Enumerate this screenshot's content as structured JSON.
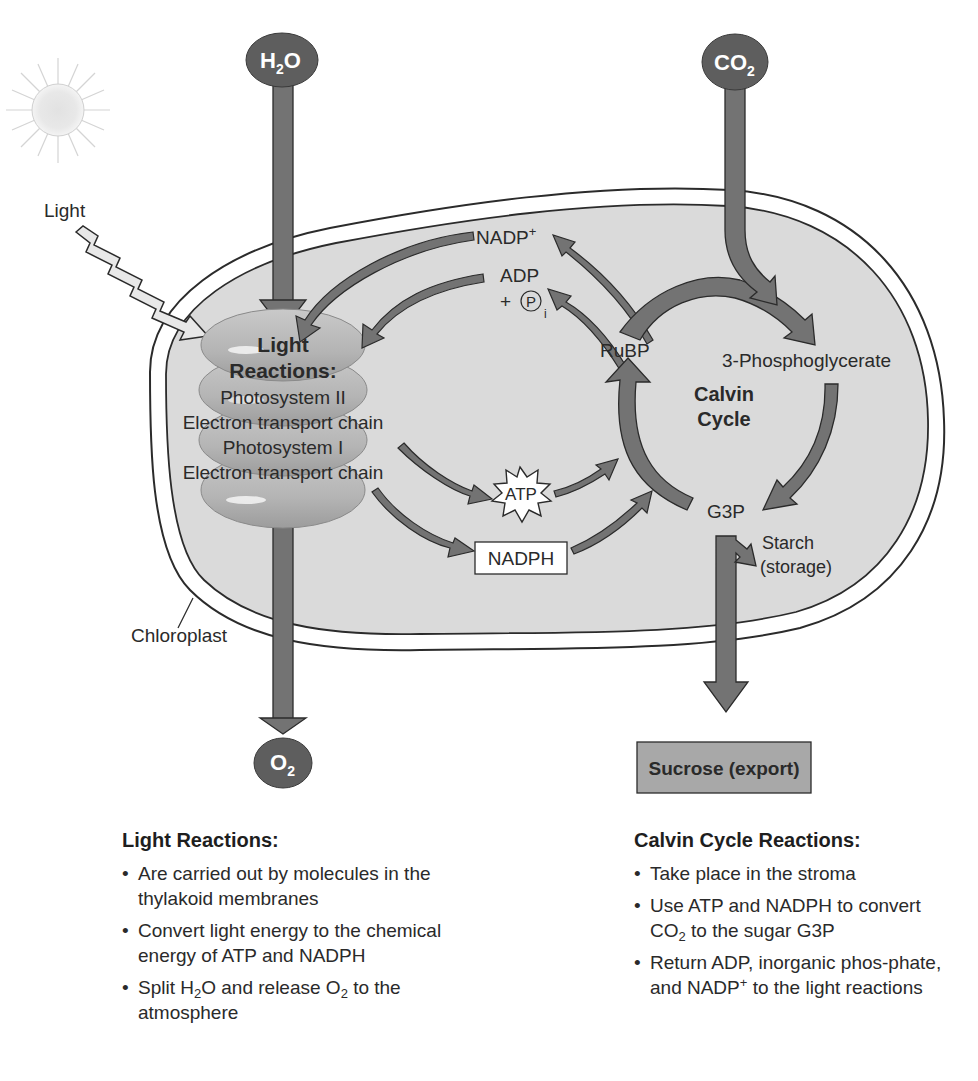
{
  "inputs": {
    "water": {
      "label": "H",
      "sub": "2",
      "suffix": "O"
    },
    "carbon_dioxide": {
      "label": "CO",
      "sub": "2"
    }
  },
  "outputs": {
    "oxygen": {
      "label": "O",
      "sub": "2"
    },
    "sucrose": "Sucrose (export)",
    "starch_line1": "Starch",
    "starch_line2": "(storage)"
  },
  "light_label": "Light",
  "chloroplast_label": "Chloroplast",
  "thylakoid": {
    "title_line1": "Light",
    "title_line2": "Reactions:",
    "items": [
      "Photosystem II",
      "Electron transport chain",
      "Photosystem I",
      "Electron transport chain"
    ]
  },
  "carriers": {
    "nadp_plus": "NADP",
    "nadp_plus_sup": "+",
    "adp": "ADP",
    "plus": "+",
    "pi_symbol": "P",
    "pi_sub": "i",
    "atp": "ATP",
    "nadph": "NADPH"
  },
  "calvin": {
    "title_line1": "Calvin",
    "title_line2": "Cycle",
    "rubp": "RuBP",
    "pga": "3-Phosphoglycerate",
    "g3p": "G3P"
  },
  "notes_light": {
    "title": "Light Reactions:",
    "bullets": [
      "Are carried out by molecules in the thylakoid membranes",
      "Convert light energy to the chemical energy of ATP and NADPH",
      {
        "pre": "Split H",
        "sub1": "2",
        "mid": "O and release O",
        "sub2": "2",
        "post": " to the atmosphere"
      }
    ]
  },
  "notes_calvin": {
    "title": "Calvin Cycle Reactions:",
    "bullets": [
      "Take place in the stroma",
      {
        "pre": "Use ATP and NADPH to convert CO",
        "sub": "2",
        "post": " to the sugar G3P"
      },
      {
        "pre": "Return ADP, inorganic phos-phate, and NADP",
        "sup": "+",
        "post": " to the light reactions"
      }
    ]
  },
  "colors": {
    "arrow_fill": "#737373",
    "arrow_stroke": "#2b2b2b",
    "molecule_fill": "#5e5e5e",
    "stroma_fill": "#dadada",
    "thylakoid_fill": "#b8b8b8",
    "sucrose_fill": "#a8a8a8",
    "sun_fill": "#e6e6e6"
  }
}
